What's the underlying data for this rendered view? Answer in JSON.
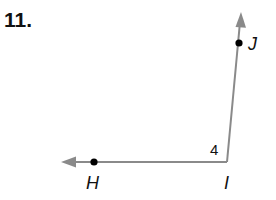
{
  "problem_number": "11.",
  "figure": {
    "type": "angle",
    "vertex": {
      "label": "I",
      "x": 227,
      "y": 162
    },
    "ray_points": [
      {
        "label": "J",
        "x": 239,
        "y": 43
      },
      {
        "label": "H",
        "x": 94,
        "y": 162
      }
    ],
    "angle_label": "4",
    "line_color": "#8a8a8a",
    "point_color": "#000000"
  }
}
